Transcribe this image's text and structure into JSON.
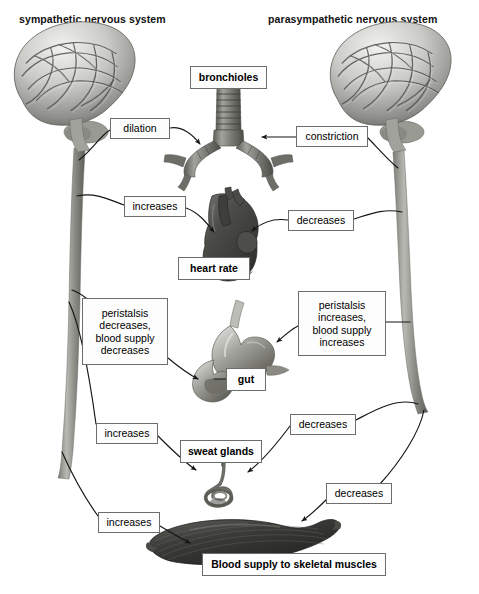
{
  "diagram": {
    "title_left": "sympathetic nervous system",
    "title_right": "parasympathetic nervous system",
    "background": "#ffffff",
    "line_color": "#1a1a1a",
    "box_border": "#6d6d6d"
  },
  "labels": {
    "dilation": "dilation",
    "constriction": "constriction",
    "bronchioles": "bronchioles",
    "increases_heart": "increases",
    "decreases_heart": "decreases",
    "heart_rate": "heart rate",
    "peristalsis_decreases": "peristalsis\ndecreases,\nblood supply\ndecreases",
    "peristalsis_increases": "peristalsis\nincreases,\nblood supply\nincreases",
    "gut": "gut",
    "increases_sweat": "increases",
    "decreases_sweat": "decreases",
    "sweat_glands": "sweat glands",
    "decreases_muscle": "decreases",
    "increases_muscle": "increases",
    "blood_supply_muscles": "Blood supply to skeletal muscles"
  },
  "organs": [
    {
      "name": "brain-left",
      "label": "brain (sympathetic)"
    },
    {
      "name": "brain-right",
      "label": "brain (parasympathetic)"
    },
    {
      "name": "bronchioles",
      "label": "bronchioles / trachea"
    },
    {
      "name": "heart",
      "label": "heart"
    },
    {
      "name": "gut",
      "label": "gut / stomach"
    },
    {
      "name": "sweat-gland",
      "label": "sweat gland"
    },
    {
      "name": "skeletal-muscle",
      "label": "skeletal muscle"
    }
  ],
  "connections": [
    {
      "from": "brain-left",
      "to": "bronchioles",
      "effect": "dilation"
    },
    {
      "from": "brain-right",
      "to": "bronchioles",
      "effect": "constriction"
    },
    {
      "from": "brain-left",
      "to": "heart",
      "effect": "increases"
    },
    {
      "from": "brain-right",
      "to": "heart",
      "effect": "decreases"
    },
    {
      "from": "brain-left",
      "to": "gut",
      "effect": "peristalsis decreases, blood supply decreases"
    },
    {
      "from": "brain-right",
      "to": "gut",
      "effect": "peristalsis increases, blood supply increases"
    },
    {
      "from": "brain-left",
      "to": "sweat-gland",
      "effect": "increases"
    },
    {
      "from": "brain-right",
      "to": "sweat-gland",
      "effect": "decreases"
    },
    {
      "from": "brain-left",
      "to": "skeletal-muscle",
      "effect": "increases"
    },
    {
      "from": "brain-right",
      "to": "skeletal-muscle",
      "effect": "decreases"
    }
  ]
}
